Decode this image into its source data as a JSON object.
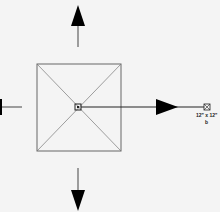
{
  "diagram": {
    "type": "plan-view-symbol",
    "colors": {
      "background": "#f4f4f4",
      "line": "#555555",
      "arrow": "#000000"
    },
    "element_label": "12\" x 12\"",
    "element_sublabel": "b",
    "arrows": [
      "up",
      "down",
      "left",
      "right"
    ]
  }
}
